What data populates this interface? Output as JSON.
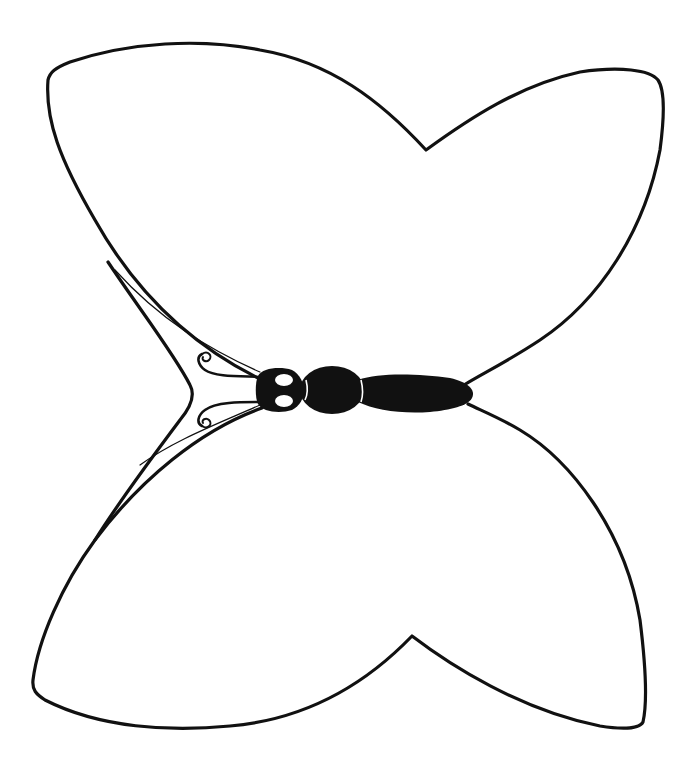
{
  "image": {
    "subject": "butterfly outline line drawing",
    "style": "black ink outline on white, coloring-page style",
    "colors": {
      "background": "#ffffff",
      "ink": "#111111"
    }
  },
  "figure": {
    "parts": [
      "upper-left-wing",
      "upper-right-wing",
      "lower-left-wing",
      "lower-right-wing",
      "head",
      "thorax",
      "abdomen",
      "antennae"
    ],
    "orientation": "body horizontal, head pointing left"
  }
}
